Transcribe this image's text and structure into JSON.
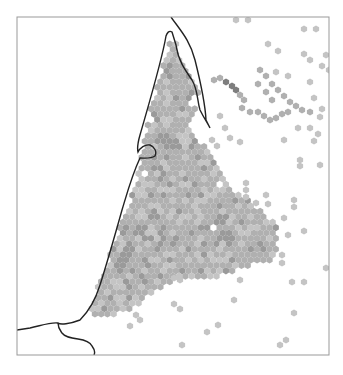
{
  "figure": {
    "type": "hexbin-density-map",
    "frame": {
      "x0": 17,
      "y0": 17,
      "x1": 329,
      "y1": 355,
      "stroke": "#999999"
    },
    "coastline_color": "#222222",
    "hex_radius": 3.6,
    "colors": {
      "light": "#c4c4c4",
      "mid": "#b0b0b0",
      "dark": "#9a9a9a",
      "darker": "#7e7e7e",
      "darkest": "#5a5a5a"
    }
  },
  "chart_data": {
    "type": "heatmap",
    "title": "",
    "xlabel": "",
    "ylabel": "",
    "legend": "none",
    "grid": false,
    "main_region_polygon": [
      [
        170,
        40
      ],
      [
        176,
        40
      ],
      [
        180,
        60
      ],
      [
        200,
        95
      ],
      [
        196,
        110
      ],
      [
        190,
        125
      ],
      [
        200,
        140
      ],
      [
        215,
        160
      ],
      [
        232,
        190
      ],
      [
        262,
        210
      ],
      [
        278,
        225
      ],
      [
        278,
        258
      ],
      [
        250,
        265
      ],
      [
        225,
        275
      ],
      [
        200,
        280
      ],
      [
        170,
        282
      ],
      [
        150,
        295
      ],
      [
        130,
        310
      ],
      [
        100,
        320
      ],
      [
        90,
        310
      ],
      [
        100,
        280
      ],
      [
        115,
        240
      ],
      [
        130,
        200
      ],
      [
        138,
        170
      ],
      [
        145,
        140
      ],
      [
        150,
        110
      ],
      [
        160,
        75
      ]
    ],
    "holes": [
      [
        149,
        120
      ],
      [
        193,
        100
      ],
      [
        144,
        174
      ],
      [
        219,
        186
      ],
      [
        213,
        228
      ],
      [
        252,
        91
      ],
      [
        252,
        105
      ]
    ],
    "dark_spots": [
      [
        225,
        88
      ],
      [
        232,
        90
      ],
      [
        240,
        104
      ],
      [
        128,
        254
      ],
      [
        140,
        230
      ],
      [
        162,
        140
      ],
      [
        145,
        95
      ],
      [
        175,
        145
      ],
      [
        225,
        235
      ],
      [
        155,
        215
      ],
      [
        120,
        265
      ]
    ],
    "outliers": [
      [
        236,
        20
      ],
      [
        248,
        20
      ],
      [
        304,
        29
      ],
      [
        316,
        29
      ],
      [
        268,
        44
      ],
      [
        278,
        51
      ],
      [
        304,
        54
      ],
      [
        310,
        60
      ],
      [
        326,
        55
      ],
      [
        322,
        66
      ],
      [
        329,
        70
      ],
      [
        288,
        76
      ],
      [
        276,
        72
      ],
      [
        310,
        82
      ],
      [
        314,
        98
      ],
      [
        322,
        109
      ],
      [
        320,
        117
      ],
      [
        220,
        116
      ],
      [
        225,
        128
      ],
      [
        230,
        138
      ],
      [
        240,
        142
      ],
      [
        212,
        140
      ],
      [
        217,
        146
      ],
      [
        284,
        140
      ],
      [
        298,
        128
      ],
      [
        310,
        128
      ],
      [
        318,
        134
      ],
      [
        314,
        141
      ],
      [
        300,
        160
      ],
      [
        300,
        166
      ],
      [
        320,
        165
      ],
      [
        246,
        183
      ],
      [
        246,
        190
      ],
      [
        246,
        197
      ],
      [
        256,
        203
      ],
      [
        266,
        195
      ],
      [
        268,
        204
      ],
      [
        294,
        200
      ],
      [
        294,
        207
      ],
      [
        284,
        218
      ],
      [
        288,
        235
      ],
      [
        304,
        231
      ],
      [
        282,
        255
      ],
      [
        282,
        263
      ],
      [
        326,
        268
      ],
      [
        240,
        280
      ],
      [
        292,
        282
      ],
      [
        304,
        282
      ],
      [
        174,
        278
      ],
      [
        180,
        280
      ],
      [
        234,
        300
      ],
      [
        174,
        304
      ],
      [
        180,
        309
      ],
      [
        294,
        313
      ],
      [
        218,
        325
      ],
      [
        207,
        332
      ],
      [
        182,
        345
      ],
      [
        280,
        345
      ],
      [
        286,
        340
      ],
      [
        136,
        315
      ],
      [
        140,
        320
      ],
      [
        130,
        326
      ]
    ],
    "coastline_paths": [
      "M171,17 C180,30 190,40 195,60 C200,80 205,100 206,120 L210,128 C208,124 204,118 200,110 C197,100 198,90 192,80 C185,70 178,60 176,45 L172,32 C169,30 167,33 166,36 C162,60 150,100 140,135 C138,142 137,148 138,152 C140,148 145,144 150,145 C155,147 157,152 155,156 C150,159 145,158 140,158 C132,175 128,190 122,210 C115,235 108,260 100,285 C96,298 90,310 80,320 C70,324 60,325 58,323 C50,322 40,326 30,328 L17,330",
      "M58,323 C58,328 60,330 62,333 C65,337 70,338 78,339 C85,340 90,342 92,346 C95,350 95,353 94,355"
    ]
  }
}
